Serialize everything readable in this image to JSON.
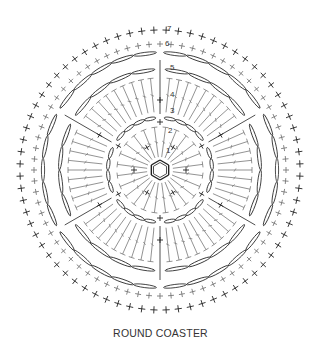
{
  "caption": "ROUND COASTER",
  "diagram": {
    "type": "crochet-chart",
    "center": [
      160,
      170
    ],
    "round_labels": [
      "1",
      "2",
      "3",
      "4",
      "5",
      "6",
      "7"
    ],
    "colors": {
      "dark": "#222222",
      "gray": "#777777",
      "background": "#ffffff"
    },
    "fans": 6,
    "inner_stitches": 24,
    "outer_sc_count": 72
  }
}
